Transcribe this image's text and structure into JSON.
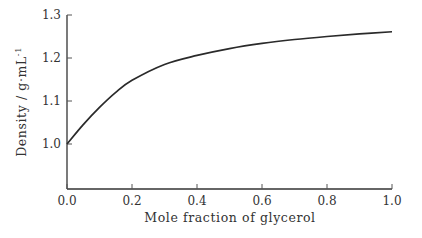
{
  "chart_data": {
    "type": "line",
    "title": "",
    "xlabel": "Mole fraction of glycerol",
    "ylabel": "Density / g·mL⁻¹",
    "xlim": [
      0.0,
      1.0
    ],
    "ylim": [
      1.0,
      1.3
    ],
    "xticks": [
      "0.0",
      "0.2",
      "0.4",
      "0.6",
      "0.8",
      "1.0"
    ],
    "yticks": [
      "1.0",
      "1.1",
      "1.2",
      "1.3"
    ],
    "grid": false,
    "legend": null,
    "series": [
      {
        "name": "Density",
        "x": [
          0.0,
          0.05,
          0.1,
          0.15,
          0.2,
          0.3,
          0.4,
          0.5,
          0.6,
          0.7,
          0.8,
          0.9,
          1.0
        ],
        "y": [
          1.0,
          1.045,
          1.085,
          1.12,
          1.148,
          1.185,
          1.206,
          1.222,
          1.234,
          1.243,
          1.25,
          1.256,
          1.261
        ]
      }
    ]
  },
  "axes": {
    "x_title": "Mole fraction of glycerol",
    "y_title_main": "Density / g·mL",
    "y_title_sup": "-1"
  }
}
